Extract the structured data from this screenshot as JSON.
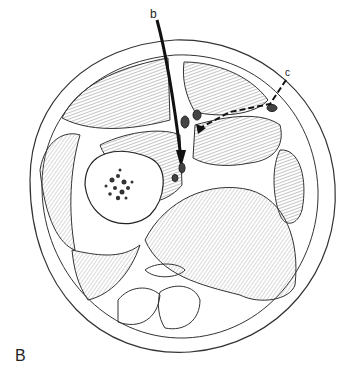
{
  "figure": {
    "panel_label": "B",
    "labels": {
      "b": "b",
      "c": "c"
    },
    "colors": {
      "line": "#222222",
      "hatch": "#9a9a9a",
      "background": "#ffffff"
    }
  }
}
